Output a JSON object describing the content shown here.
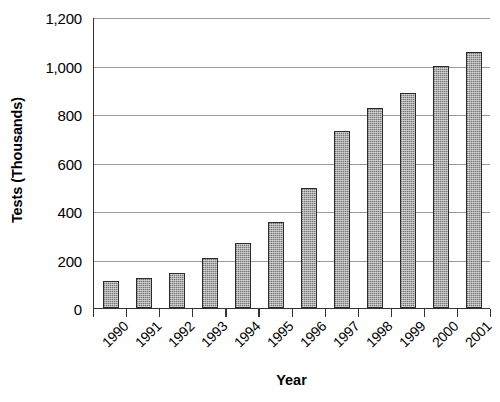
{
  "chart_data": {
    "type": "bar",
    "title": "",
    "xlabel": "Year",
    "ylabel": "Tests (Thousands)",
    "categories": [
      "1990",
      "1991",
      "1992",
      "1993",
      "1994",
      "1995",
      "1996",
      "1997",
      "1998",
      "1999",
      "2000",
      "2001"
    ],
    "values": [
      110,
      122,
      145,
      205,
      270,
      355,
      495,
      730,
      825,
      885,
      1000,
      1055
    ],
    "series": [
      {
        "name": "Tests",
        "values": [
          110,
          122,
          145,
          205,
          270,
          355,
          495,
          730,
          825,
          885,
          1000,
          1055
        ]
      }
    ],
    "ylim": [
      0,
      1200
    ],
    "ytick_values": [
      0,
      200,
      400,
      600,
      800,
      1000,
      1200
    ],
    "ytick_labels": [
      "0",
      "200",
      "400",
      "600",
      "800",
      "1,000",
      "1,200"
    ],
    "grid": true,
    "grid_axis": "y",
    "legend": false,
    "legend_position": "none",
    "bar_fill_color": "#8d8d8d",
    "bar_edge_color": "#2b2b2b",
    "gridline_color": "#9a9a9a",
    "axis_color": "#333333",
    "background_color": "#ffffff",
    "xtick_label_rotation": -45
  }
}
